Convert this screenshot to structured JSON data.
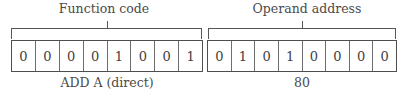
{
  "diagram": {
    "type": "instruction-format",
    "fields": [
      {
        "id": "function-code",
        "top_label": "Function code",
        "bottom_caption": "ADD A (direct)",
        "bits": [
          "0",
          "0",
          "0",
          "0",
          "1",
          "0",
          "0",
          "1"
        ]
      },
      {
        "id": "operand-address",
        "top_label": "Operand address",
        "bottom_caption": "80",
        "bits": [
          "0",
          "1",
          "0",
          "1",
          "0",
          "0",
          "0",
          "0"
        ]
      }
    ],
    "colors": {
      "background": "#ffffff",
      "box_border": "#4f4f53",
      "cell_divider": "#6e6e72",
      "bracket": "#55555a",
      "text": "#3f3f42"
    }
  }
}
